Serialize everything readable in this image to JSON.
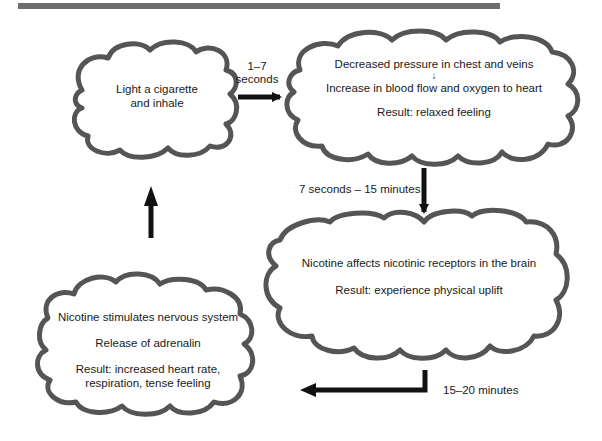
{
  "diagram": {
    "type": "cycle-flowchart",
    "colors": {
      "outline": "#555555",
      "arrow": "#111111",
      "topbar": "#6e6e6e",
      "text": "#1a1a1a"
    },
    "nodes": [
      {
        "id": "light",
        "lines": [
          "Light a cigarette",
          "and inhale"
        ]
      },
      {
        "id": "relax",
        "line1": "Decreased pressure in chest and veins",
        "connector": "↓",
        "line2": "Increase in blood flow and oxygen to heart",
        "result": "Result: relaxed feeling"
      },
      {
        "id": "uplift",
        "line1": "Nicotine affects nicotinic receptors in the brain",
        "result": "Result: experience physical uplift"
      },
      {
        "id": "tense",
        "line1": "Nicotine stimulates nervous system",
        "line2": "Release of adrenalin",
        "result1": "Result: increased heart rate,",
        "result2": "respiration, tense feeling"
      }
    ],
    "edges": [
      {
        "from": "light",
        "to": "relax",
        "label1": "1–7",
        "label2": "seconds"
      },
      {
        "from": "relax",
        "to": "uplift",
        "label": "7 seconds – 15 minutes"
      },
      {
        "from": "uplift",
        "to": "tense",
        "label": "15–20 minutes"
      },
      {
        "from": "tense",
        "to": "light",
        "label": ""
      }
    ]
  }
}
